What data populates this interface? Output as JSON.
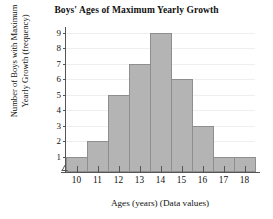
{
  "chart_data": {
    "type": "bar",
    "title": "Boys' Ages of Maximum Yearly Growth",
    "xlabel": "Ages (years) (Data values)",
    "ylabel": "Number of Boys with Maximum Yearly Growth (frequency)",
    "ylabel_line1": "Number of Boys with Maximum",
    "ylabel_line2": "Yearly Growth (frequency)",
    "categories": [
      "10",
      "11",
      "12",
      "13",
      "14",
      "15",
      "16",
      "17",
      "18"
    ],
    "values": [
      1,
      2,
      5,
      7,
      9,
      6,
      3,
      1,
      1
    ],
    "ylim": [
      0,
      9
    ],
    "yticks": [
      "9",
      "8",
      "7",
      "6",
      "5",
      "4",
      "3",
      "2",
      "1"
    ],
    "ytick_values": [
      9,
      8,
      7,
      6,
      5,
      4,
      3,
      2,
      1
    ],
    "xticks": [
      "10",
      "11",
      "12",
      "13",
      "14",
      "15",
      "16",
      "17",
      "18"
    ],
    "grid": true,
    "legend": false,
    "bar_color": "#b4b4b4",
    "bar_edge_color": "#8e8e8e",
    "axis_color": "#555555",
    "gridline_color": "#efefef",
    "axis_break": true
  }
}
